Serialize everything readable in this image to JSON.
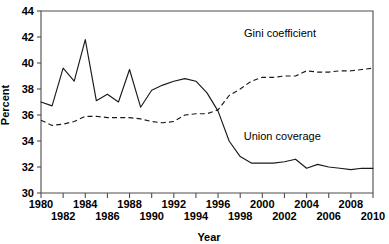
{
  "chart_data": {
    "type": "line",
    "title": "",
    "xlabel": "Year",
    "ylabel": "Percent",
    "xlim": [
      1980,
      2010
    ],
    "ylim": [
      30,
      44
    ],
    "grid": false,
    "legend_position": "inline-annotation",
    "x": [
      1980,
      1981,
      1982,
      1983,
      1984,
      1985,
      1986,
      1987,
      1988,
      1989,
      1990,
      1991,
      1992,
      1993,
      1994,
      1995,
      1996,
      1997,
      1998,
      1999,
      2000,
      2001,
      2002,
      2003,
      2004,
      2005,
      2006,
      2007,
      2008,
      2009,
      2010
    ],
    "series": [
      {
        "name": "Union coverage",
        "style": "solid",
        "values": [
          37.0,
          36.7,
          39.6,
          38.6,
          41.8,
          37.1,
          37.6,
          37.0,
          39.5,
          36.6,
          37.9,
          38.3,
          38.6,
          38.8,
          38.6,
          37.7,
          36.3,
          34.0,
          32.8,
          32.3,
          32.3,
          32.3,
          32.4,
          32.6,
          31.9,
          32.2,
          32.0,
          31.9,
          31.8,
          31.9,
          31.9
        ]
      },
      {
        "name": "Gini coefficient",
        "style": "dashed",
        "values": [
          35.6,
          35.2,
          35.3,
          35.5,
          35.9,
          35.9,
          35.8,
          35.8,
          35.8,
          35.7,
          35.5,
          35.4,
          35.5,
          36.0,
          36.1,
          36.1,
          36.4,
          37.5,
          38.0,
          38.6,
          38.9,
          38.9,
          39.0,
          39.0,
          39.4,
          39.3,
          39.3,
          39.4,
          39.4,
          39.5,
          39.6
        ]
      }
    ],
    "y_ticks": [
      30,
      32,
      34,
      36,
      38,
      40,
      42,
      44
    ],
    "x_ticks": [
      1980,
      1982,
      1984,
      1986,
      1988,
      1990,
      1992,
      1994,
      1996,
      1998,
      2000,
      2002,
      2004,
      2006,
      2008,
      2010
    ],
    "x_ticks_upper_row": [
      1980,
      1984,
      1988,
      1992,
      1996,
      2000,
      2004,
      2008
    ],
    "x_ticks_lower_row": [
      1982,
      1986,
      1990,
      1994,
      1998,
      2002,
      2006,
      2010
    ],
    "annotations": [
      {
        "name": "gini-label",
        "text": "Gini coefficient",
        "x": 2001.6,
        "y": 42.0
      },
      {
        "name": "union-label",
        "text": "Union coverage",
        "x": 2001.8,
        "y": 34.1
      }
    ],
    "colors": {
      "line": "#1a1a1a",
      "axis": "#4d4d4d",
      "background": "#ffffff",
      "text": "#000000"
    }
  }
}
